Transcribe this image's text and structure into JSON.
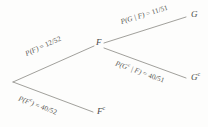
{
  "figure": {
    "type": "probability-tree-diagram",
    "background_color": "#fdfdfc",
    "line_color": "#6e6c66",
    "text_color": "#55544f"
  },
  "nodes": {
    "root": {
      "label": "",
      "x": 12,
      "y": 82
    },
    "f": {
      "label": "F",
      "superscript": "",
      "x": 98,
      "y": 45
    },
    "f_complement": {
      "label": "F",
      "superscript": "c",
      "x": 99,
      "y": 112
    },
    "g": {
      "label": "G",
      "superscript": "",
      "x": 193,
      "y": 17
    },
    "g_complement": {
      "label": "G",
      "superscript": "c",
      "x": 193,
      "y": 77
    }
  },
  "branches": [
    {
      "name": "root-to-f",
      "label_prefix": "P(F)",
      "label_equals": " = ",
      "label_value": "12/52",
      "full_text": "P(F) = 12/52",
      "numerator": 12,
      "denominator": 52,
      "from": "root",
      "to": "f"
    },
    {
      "name": "root-to-f-complement",
      "label_prefix": "P(F",
      "label_prefix_sup": "c",
      "label_prefix_tail": ")",
      "label_equals": " = ",
      "label_value": "40/52",
      "full_text": "P(Fc) = 40/52",
      "numerator": 40,
      "denominator": 52,
      "from": "root",
      "to": "f_complement"
    },
    {
      "name": "f-to-g",
      "label_prefix": "P(G | F)",
      "label_equals": " = ",
      "label_value": "11/51",
      "full_text": "P(G | F) = 11/51",
      "numerator": 11,
      "denominator": 51,
      "from": "f",
      "to": "g"
    },
    {
      "name": "f-to-g-complement",
      "label_prefix": "P(G",
      "label_prefix_sup": "c",
      "label_prefix_tail": " | F)",
      "label_equals": " = ",
      "label_value": "40/51",
      "full_text": "P(Gc | F) = 40/51",
      "numerator": 40,
      "denominator": 51,
      "from": "f",
      "to": "g_complement"
    }
  ]
}
